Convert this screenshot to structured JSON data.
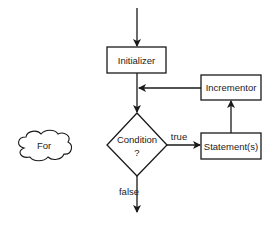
{
  "diagram": {
    "nodes": {
      "cloud": {
        "label": "For",
        "shape": "cloud"
      },
      "initializer": {
        "label": "Initializer",
        "shape": "rectangle"
      },
      "incrementor": {
        "label": "Incrementor",
        "shape": "rectangle"
      },
      "condition": {
        "label_line1": "Condition",
        "label_line2": "?",
        "shape": "diamond"
      },
      "statements": {
        "label": "Statement(s)",
        "shape": "rectangle"
      }
    },
    "edges": {
      "true_label": "true",
      "false_label": "false"
    },
    "colors": {
      "stroke": "#1a1a1a",
      "background": "#ffffff",
      "text": "#222222"
    }
  }
}
